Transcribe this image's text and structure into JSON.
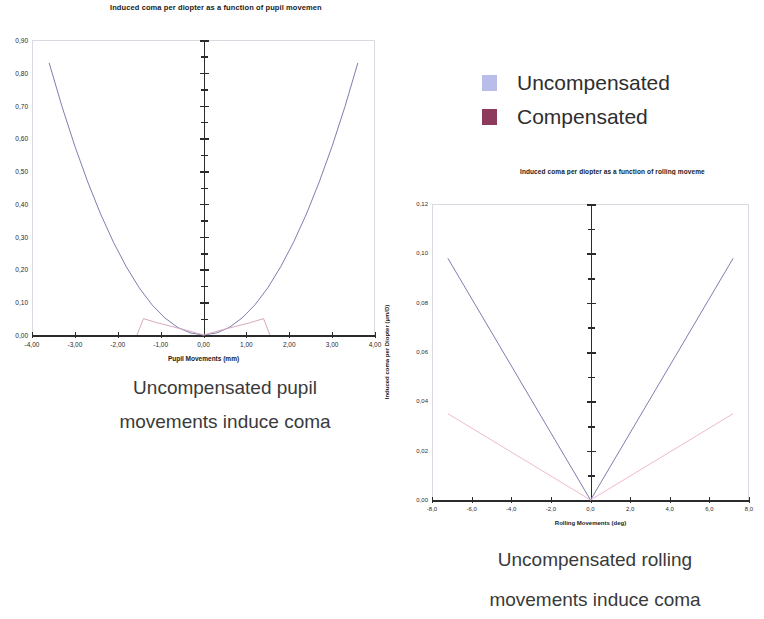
{
  "legend": {
    "items": [
      {
        "label": "Uncompensated",
        "color": "#b9bde9",
        "name": "uncompensated"
      },
      {
        "label": "Compensated",
        "color": "#8d3a5d",
        "name": "compensated"
      }
    ]
  },
  "captions": {
    "pupil_line1": "Uncompensated pupil",
    "pupil_line2": "movements induce coma",
    "rolling_line1": "Uncompensated rolling",
    "rolling_line2": "movements induce coma"
  },
  "chart_data": [
    {
      "id": "pupil",
      "type": "line",
      "title": "Induced coma per diopter as a function of pupil movemen",
      "xlabel": "Pupil Movements (mm)",
      "ylabel": "Induced coma per Diopter (µm/D)",
      "xlim": [
        -4.0,
        4.0
      ],
      "ylim": [
        0.0,
        0.9
      ],
      "xticks": [
        -4.0,
        -3.0,
        -2.0,
        -1.0,
        0.0,
        1.0,
        2.0,
        3.0,
        4.0
      ],
      "xticklabels": [
        "-4,00",
        "-3,00",
        "-2,00",
        "-1,00",
        "0,00",
        "1,00",
        "2,00",
        "3,00",
        "4,00"
      ],
      "yticks": [
        0.0,
        0.1,
        0.2,
        0.3,
        0.4,
        0.5,
        0.6,
        0.7,
        0.8,
        0.9
      ],
      "yticklabels": [
        "0,00",
        "0,10",
        "0,20",
        "0,30",
        "0,40",
        "0,50",
        "0,60",
        "0,70",
        "0,80",
        "0,90"
      ],
      "grid": false,
      "legend_position": "external-top-right",
      "series": [
        {
          "name": "Uncompensated",
          "color": "#7b7fae",
          "x": [
            -3.6,
            -3.3,
            -3.0,
            -2.7,
            -2.4,
            -2.1,
            -1.8,
            -1.5,
            -1.2,
            -0.9,
            -0.6,
            -0.3,
            0.0,
            0.3,
            0.6,
            0.9,
            1.2,
            1.5,
            1.8,
            2.1,
            2.4,
            2.7,
            3.0,
            3.3,
            3.6
          ],
          "values": [
            0.83,
            0.697,
            0.576,
            0.467,
            0.369,
            0.283,
            0.208,
            0.144,
            0.092,
            0.052,
            0.023,
            0.006,
            0.0,
            0.006,
            0.023,
            0.052,
            0.092,
            0.144,
            0.208,
            0.283,
            0.369,
            0.467,
            0.576,
            0.697,
            0.83
          ]
        },
        {
          "name": "Compensated",
          "color": "#d9a8c0",
          "x": [
            -1.55,
            -1.4,
            -1.1,
            -0.8,
            -0.5,
            -0.25,
            0.0,
            0.25,
            0.5,
            0.8,
            1.1,
            1.4,
            1.55
          ],
          "values": [
            0.0,
            0.05,
            0.038,
            0.028,
            0.018,
            0.009,
            0.0,
            0.009,
            0.018,
            0.028,
            0.038,
            0.05,
            0.0
          ]
        }
      ]
    },
    {
      "id": "rolling",
      "type": "line",
      "title": "Induced coma per diopter as a function of rolling moveme",
      "xlabel": "Rolling Movements (deg)",
      "ylabel": "Induced coma per Diopter (µm/D)",
      "xlim": [
        -8.0,
        8.0
      ],
      "ylim": [
        0.0,
        0.12
      ],
      "xticks": [
        -8.0,
        -6.0,
        -4.0,
        -2.0,
        0.0,
        2.0,
        4.0,
        6.0,
        8.0
      ],
      "xticklabels": [
        "-8,0",
        "-6,0",
        "-4,0",
        "-2,0",
        "0,0",
        "2,0",
        "4,0",
        "6,0",
        "8,0"
      ],
      "yticks": [
        0.0,
        0.02,
        0.04,
        0.06,
        0.08,
        0.1,
        0.12
      ],
      "yticklabels": [
        "0,00",
        "0,02",
        "0,04",
        "0,06",
        "0,08",
        "0,10",
        "0,12"
      ],
      "grid": false,
      "legend_position": "external-top-right",
      "series": [
        {
          "name": "Uncompensated",
          "color": "#7b7fae",
          "x": [
            -7.2,
            0.0,
            7.2
          ],
          "values": [
            0.098,
            0.0,
            0.098
          ]
        },
        {
          "name": "Compensated",
          "color": "#f0b9cf",
          "x": [
            -7.2,
            0.0,
            7.2
          ],
          "values": [
            0.035,
            0.0,
            0.035
          ]
        }
      ]
    }
  ]
}
